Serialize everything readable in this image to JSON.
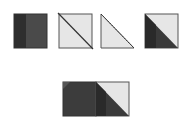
{
  "diagram": {
    "colors": {
      "dark": "#3a3a3a",
      "dark_stripe": "#2a2a2a",
      "medium_dark": "#4a4a4a",
      "light": "#e6e6e6",
      "outline": "#444444",
      "background": "#ffffff"
    },
    "steps": [
      {
        "id": "step-1",
        "description": "Strip-pieced dark square"
      },
      {
        "id": "step-2",
        "description": "Light square with diagonal line"
      },
      {
        "id": "step-3",
        "description": "Trimmed light triangle with seam line"
      },
      {
        "id": "step-4",
        "description": "Half-square triangle, dark and light"
      },
      {
        "id": "step-5",
        "description": "Joined unit: dark square beside half-square triangle"
      }
    ]
  }
}
